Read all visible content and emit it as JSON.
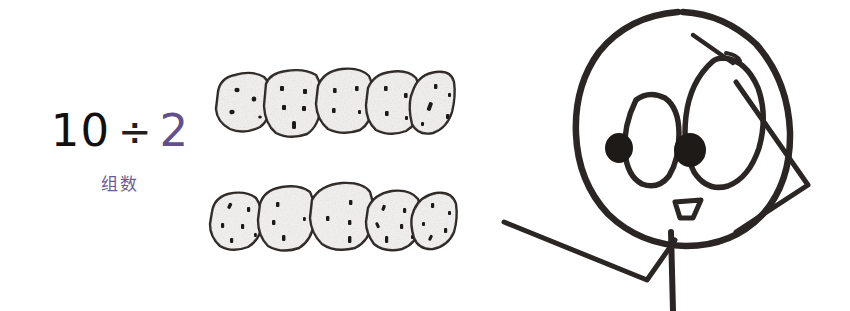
{
  "page": {
    "background_color": "#ffffff",
    "width": 850,
    "height": 311
  },
  "equation": {
    "dividend": "10",
    "operator": "÷",
    "divisor": "2",
    "caption": "组数",
    "dividend_color": "#14100f",
    "operator_color": "#231f20",
    "divisor_color": "#63508a",
    "caption_color": "#6b5b95"
  },
  "cookies": {
    "outline_color": "#2b2522",
    "fill_color": "#f2f1ef",
    "chip_color": "#1c1a19",
    "rows": [
      {
        "name": "cookie-row-top",
        "count": 5,
        "label": "5"
      },
      {
        "name": "cookie-row-bottom",
        "count": 5,
        "label": "5"
      }
    ],
    "total": "10"
  },
  "face": {
    "ink_color": "#2b2623",
    "parts": [
      "head-outline",
      "left-eye",
      "right-eye",
      "left-pupil",
      "right-pupil",
      "mouth",
      "hair-strand",
      "collar",
      "left-arm",
      "body-line"
    ]
  }
}
